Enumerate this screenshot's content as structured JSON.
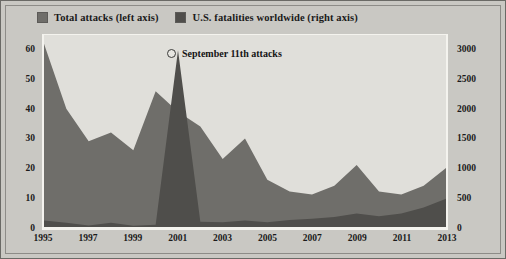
{
  "legend": {
    "items": [
      {
        "label": "Total attacks (left axis)",
        "color": "#6f6e6a",
        "icon": "legend-swatch-icon"
      },
      {
        "label": "U.S. fatalities worldwide (right axis)",
        "color": "#4f4e4b",
        "icon": "legend-swatch-icon"
      }
    ]
  },
  "annotation": {
    "text": "September 11th attacks",
    "marker": "circle-marker-icon"
  },
  "colors": {
    "panel_background": "#c9c8c3",
    "plot_background": "#e0dfda",
    "attacks_area": "#6f6e6a",
    "fatalities_area": "#4f4e4b",
    "axis_line": "#f4f3ee",
    "text": "#1a1a1a"
  },
  "chart_data": {
    "type": "area",
    "title": "",
    "subtitle": "",
    "xlabel": "",
    "ylabel": "Total attacks",
    "y2label": "U.S. fatalities worldwide",
    "grid": false,
    "legend_position": "top-left",
    "x": [
      1995,
      1996,
      1997,
      1998,
      1999,
      2000,
      2001,
      2002,
      2003,
      2004,
      2005,
      2006,
      2007,
      2008,
      2009,
      2010,
      2011,
      2012,
      2013
    ],
    "xtick_labels": [
      "1995",
      "1997",
      "1999",
      "2001",
      "2003",
      "2005",
      "2007",
      "2009",
      "2011",
      "2013"
    ],
    "xtick_values": [
      1995,
      1997,
      1999,
      2001,
      2003,
      2005,
      2007,
      2009,
      2011,
      2013
    ],
    "ylim": [
      0,
      65
    ],
    "ytick_labels": [
      "0",
      "10",
      "20",
      "30",
      "40",
      "50",
      "60"
    ],
    "ytick_values": [
      0,
      10,
      20,
      30,
      40,
      50,
      60
    ],
    "y2lim": [
      0,
      3250
    ],
    "y2tick_labels": [
      "0",
      "500",
      "1000",
      "1500",
      "2000",
      "2500",
      "3000"
    ],
    "y2tick_values": [
      0,
      500,
      1000,
      1500,
      2000,
      2500,
      3000
    ],
    "series": [
      {
        "name": "Total attacks (left axis)",
        "axis": "left",
        "color": "#6f6e6a",
        "values": [
          62,
          40,
          29,
          32,
          26,
          46,
          39,
          34,
          23,
          30,
          16,
          12,
          11,
          14,
          21,
          12,
          11,
          14,
          20
        ]
      },
      {
        "name": "U.S. fatalities worldwide (right axis)",
        "axis": "right",
        "color": "#4f4e4b",
        "values": [
          110,
          70,
          25,
          70,
          20,
          40,
          2990,
          90,
          80,
          110,
          80,
          120,
          140,
          170,
          230,
          180,
          230,
          330,
          480
        ]
      }
    ],
    "annotations": [
      {
        "text": "September 11th attacks",
        "x": 2001,
        "series": "U.S. fatalities worldwide (right axis)"
      }
    ]
  }
}
